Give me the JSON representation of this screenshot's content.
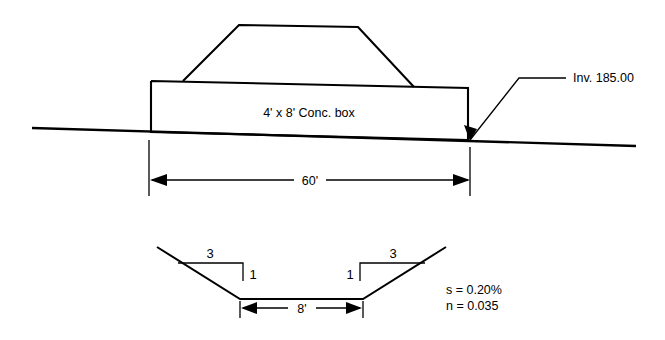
{
  "diagram": {
    "colors": {
      "line": "#000000",
      "background": "#ffffff"
    },
    "profile": {
      "box_label": "4' x 8' Conc. box",
      "invert_label": "Inv. 185.00",
      "span_dimension": "60'"
    },
    "channel": {
      "bottom_width_dimension": "8'",
      "left_slope_run": "3",
      "left_slope_rise": "1",
      "right_slope_run": "3",
      "right_slope_rise": "1",
      "slope_param": "s = 0.20%",
      "roughness_param": "n = 0.035"
    },
    "geometry": {
      "ground_line": "32,128 636,146",
      "box_outline": "151,81 468,88 468,140 151,132 151,81",
      "embankment": "183,81 239,25 358,27 414,87",
      "leader_path": "470,140 519,78 566,78",
      "span_ext_left": "149,140 149,196",
      "span_ext_right": "470,147 470,196",
      "span_dim_y": 180,
      "span_dim_x1": 152,
      "span_dim_x2": 468,
      "channel_path": "157,247 240,299 363,299 446,247",
      "bottom_ext_left": "240,301 240,318",
      "bottom_ext_right": "363,301 363,318",
      "bottom_dim_y": 308,
      "bottom_dim_x1": 243,
      "bottom_dim_x2": 360,
      "left_bracket": "178,263 243,263 243,281",
      "right_bracket": "425,263 360,263 360,281"
    }
  }
}
